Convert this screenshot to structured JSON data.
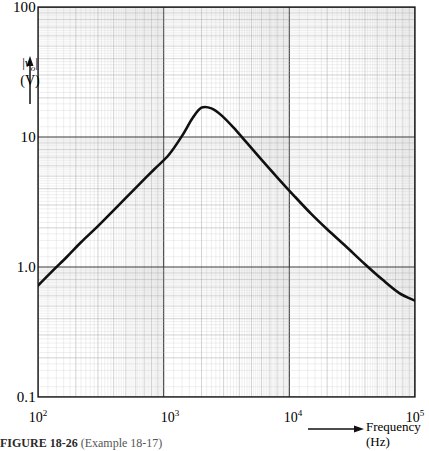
{
  "figure": {
    "caption_label": "FIGURE 18-26",
    "caption_text": "(Example 18-17)"
  },
  "axes": {
    "y_name_bars": "|",
    "y_name_symbol": "v",
    "y_name_subscript": "o",
    "y_unit": "(V)",
    "x_name": "Frequency",
    "x_unit": "(Hz)",
    "y_ticks": [
      "100",
      "10",
      "1.0",
      "0.1"
    ],
    "x_ticks": [
      "10",
      "10",
      "10",
      "10"
    ],
    "x_tick_exponents": [
      "2",
      "3",
      "4",
      "5"
    ]
  },
  "chart_data": {
    "type": "line",
    "title": "",
    "subtitle": "",
    "xlabel": "Frequency (Hz)",
    "ylabel": "|v_o| (V)",
    "xscale": "log",
    "yscale": "log",
    "xlim": [
      100,
      100000
    ],
    "ylim": [
      0.1,
      100
    ],
    "grid": "log-log graph paper, major decade lines plus 1-9 minor divisions on both axes",
    "legend": "none",
    "minor_tick_labels_x": [
      "2",
      "3",
      "4",
      "5",
      "6",
      "7",
      "8",
      "9",
      "10"
    ],
    "minor_tick_labels_y": [
      "2",
      "3",
      "4",
      "5",
      "6",
      "7",
      "8",
      "9",
      "10"
    ],
    "series": [
      {
        "name": "|v_o| magnitude response",
        "color": "#101010",
        "linewidth": 2.6,
        "x": [
          100,
          130,
          170,
          220,
          290,
          380,
          500,
          650,
          850,
          1100,
          1400,
          1700,
          2000,
          2400,
          2900,
          3600,
          4600,
          6000,
          8000,
          11000,
          15000,
          20000,
          28000,
          40000,
          55000,
          75000,
          100000
        ],
        "y": [
          0.72,
          0.93,
          1.2,
          1.55,
          2.0,
          2.6,
          3.4,
          4.4,
          5.7,
          7.3,
          10.2,
          14.0,
          16.8,
          16.6,
          14.6,
          11.8,
          9.0,
          6.7,
          4.9,
          3.5,
          2.55,
          1.95,
          1.45,
          1.05,
          0.8,
          0.63,
          0.55
        ]
      }
    ],
    "annotations": {
      "peak_frequency_hz": 2000,
      "peak_value_v": 17,
      "start_value_v": 0.72,
      "end_value_v": 0.55
    }
  }
}
